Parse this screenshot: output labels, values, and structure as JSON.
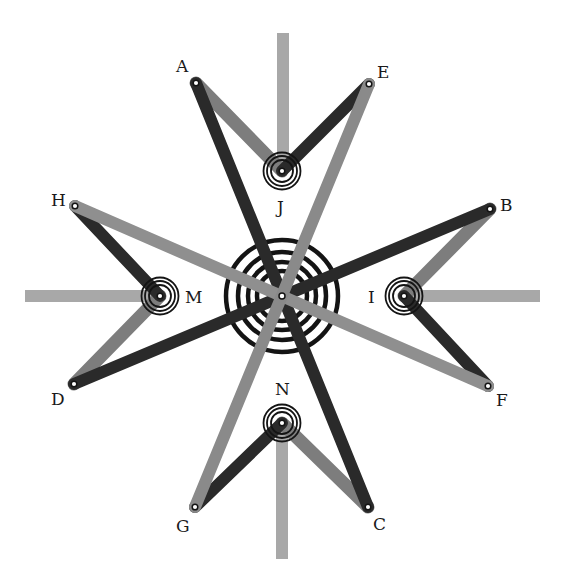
{
  "diagram": {
    "colors": {
      "background": "#ffffff",
      "dark_bar": "#2a2a2a",
      "medium_bar": "#7d7d7d",
      "light_bar": "#a8a8a8",
      "ring": "#141414",
      "pivot_fill": "#ffffff"
    },
    "center": {
      "x": 282,
      "y": 296,
      "ring_radii": [
        25,
        34,
        44,
        56
      ]
    },
    "labels": {
      "A": "A",
      "B": "B",
      "C": "C",
      "D": "D",
      "E": "E",
      "F": "F",
      "G": "G",
      "H": "H",
      "I": "I",
      "J": "J",
      "M": "M",
      "N": "N"
    },
    "outer_points": [
      {
        "id": "A",
        "x": 196,
        "y": 83
      },
      {
        "id": "E",
        "x": 369,
        "y": 84
      },
      {
        "id": "B",
        "x": 490,
        "y": 209
      },
      {
        "id": "F",
        "x": 488,
        "y": 386
      },
      {
        "id": "C",
        "x": 368,
        "y": 507
      },
      {
        "id": "G",
        "x": 195,
        "y": 507
      },
      {
        "id": "D",
        "x": 74,
        "y": 384
      },
      {
        "id": "H",
        "x": 75,
        "y": 206
      }
    ],
    "fixed_pivots": [
      {
        "id": "J",
        "x": 282,
        "y": 171
      },
      {
        "id": "I",
        "x": 404,
        "y": 296
      },
      {
        "id": "N",
        "x": 282,
        "y": 423
      },
      {
        "id": "M",
        "x": 160,
        "y": 296
      }
    ],
    "long_bars": [
      {
        "from": "A",
        "to": "C",
        "shade": "dark"
      },
      {
        "from": "B",
        "to": "D",
        "shade": "dark"
      },
      {
        "from": "E",
        "to": "G",
        "shade": "medium"
      },
      {
        "from": "H",
        "to": "F",
        "shade": "medium"
      }
    ],
    "short_links": [
      {
        "from": "A",
        "to": "J",
        "shade": "medium"
      },
      {
        "from": "E",
        "to": "J",
        "shade": "dark"
      },
      {
        "from": "B",
        "to": "I",
        "shade": "medium"
      },
      {
        "from": "F",
        "to": "I",
        "shade": "dark"
      },
      {
        "from": "C",
        "to": "N",
        "shade": "medium"
      },
      {
        "from": "G",
        "to": "N",
        "shade": "dark"
      },
      {
        "from": "D",
        "to": "M",
        "shade": "medium"
      },
      {
        "from": "H",
        "to": "M",
        "shade": "dark"
      }
    ],
    "fixed_arms": [
      {
        "pivot": "J",
        "direction": "up",
        "end_y": 33
      },
      {
        "pivot": "I",
        "direction": "right",
        "end_x": 540
      },
      {
        "pivot": "N",
        "direction": "down",
        "end_y": 559
      },
      {
        "pivot": "M",
        "direction": "left",
        "end_x": 25
      }
    ]
  }
}
